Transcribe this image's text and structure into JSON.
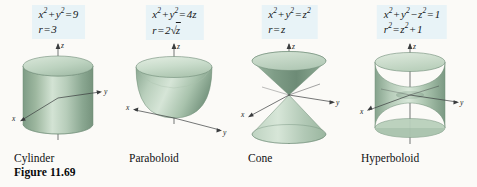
{
  "figure": {
    "number_label": "Figure 11.69",
    "background_color": "#fbfaf7",
    "equation_box_color": "#e8f3f7",
    "surface_color": "#9ab5a0",
    "surface_light_color": "#cfe0d2",
    "surface_dark_color": "#74917b",
    "axis_color": "#3a3c3e"
  },
  "panels": [
    {
      "caption": "Cylinder",
      "surface": "cylinder",
      "equation_cartesian": "x2 + y2 = 9",
      "equation_cylindrical": "r = 3",
      "axes": {
        "x": "x",
        "y": "y",
        "z": "z"
      }
    },
    {
      "caption": "Paraboloid",
      "surface": "paraboloid",
      "equation_cartesian": "x2 + y2 = 4z",
      "equation_cylindrical": "r = 2 sqrt(z)",
      "axes": {
        "x": "x",
        "y": "y",
        "z": "z"
      }
    },
    {
      "caption": "Cone",
      "surface": "cone",
      "equation_cartesian": "x2 + y2 = z2",
      "equation_cylindrical": "r = z",
      "axes": {
        "x": "x",
        "y": "y",
        "z": "z"
      }
    },
    {
      "caption": "Hyperboloid",
      "surface": "hyperboloid",
      "equation_cartesian": "x2 + y2 - z2 = 1",
      "equation_cylindrical": "r2 = z2 + 1",
      "axes": {
        "x": "x",
        "y": "y",
        "z": "z"
      }
    }
  ]
}
